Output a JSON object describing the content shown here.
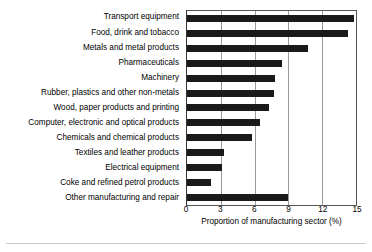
{
  "chart_data": {
    "type": "bar",
    "orientation": "horizontal",
    "title": "",
    "subtitle": "",
    "xlabel": "Proportion of manufacturing sector (%)",
    "ylabel": "",
    "xlim": [
      0,
      15
    ],
    "xticks": [
      0,
      3,
      6,
      9,
      12,
      15
    ],
    "xtick_labels": [
      "0",
      "3",
      "6",
      "9",
      "12",
      "15"
    ],
    "grid": true,
    "grid_axis": "x",
    "legend": null,
    "legend_position": "none",
    "bar_color": "#1a1a1a",
    "categories": [
      "Transport equipment",
      "Food, drink and tobacco",
      "Metals and metal products",
      "Pharmaceuticals",
      "Machinery",
      "Rubber, plastics and other non-metals",
      "Wood, paper products and printing",
      "Computer, electronic and optical products",
      "Chemicals and chemical products",
      "Textiles and leather products",
      "Electrical equipment",
      "Coke and refined petrol products",
      "Other manufacturing and repair"
    ],
    "values": [
      14.8,
      14.3,
      10.7,
      8.4,
      7.8,
      7.7,
      7.3,
      6.5,
      5.8,
      3.3,
      3.1,
      2.1,
      9.0
    ],
    "series": [
      {
        "name": "Proportion of manufacturing sector (%)",
        "values": [
          14.8,
          14.3,
          10.7,
          8.4,
          7.8,
          7.7,
          7.3,
          6.5,
          5.8,
          3.3,
          3.1,
          2.1,
          9.0
        ]
      }
    ]
  }
}
